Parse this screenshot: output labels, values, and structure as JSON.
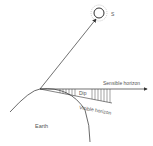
{
  "diagram": {
    "labels": {
      "sun": "S",
      "sensible_horizon": "Sensible horizon",
      "visible_horizon": "Visible horizon",
      "dip": "Dip",
      "earth": "Earth"
    },
    "colors": {
      "line": "#333333",
      "text": "#555555",
      "background": "#ffffff"
    }
  }
}
